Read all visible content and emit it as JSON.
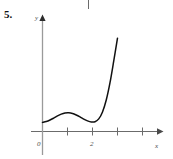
{
  "problem": {
    "number_label": "5."
  },
  "marks": {
    "top_rule": "page-crop-mark"
  },
  "chart_data": {
    "type": "line",
    "title": "",
    "subtitle": "",
    "xlabel": "x",
    "ylabel": "y",
    "xlim": [
      -0.25,
      4.6
    ],
    "ylim": [
      -0.55,
      4.5
    ],
    "grid": false,
    "legend": null,
    "axis_arrows": {
      "x_axis_arrow": true,
      "y_axis_arrow": true
    },
    "x_ticks": [
      {
        "value": 0,
        "label": "0",
        "labeled": true
      },
      {
        "value": 1,
        "label": "",
        "labeled": false
      },
      {
        "value": 2,
        "label": "2",
        "labeled": true
      },
      {
        "value": 3,
        "label": "",
        "labeled": false
      },
      {
        "value": 4,
        "label": "",
        "labeled": false
      }
    ],
    "y_ticks": [],
    "series": [
      {
        "name": "curve",
        "color": "#111111",
        "x": [
          0.0,
          0.15,
          0.3,
          0.45,
          0.6,
          0.75,
          0.9,
          1.05,
          1.2,
          1.35,
          1.5,
          1.65,
          1.8,
          1.95,
          2.1,
          2.25,
          2.4,
          2.55,
          2.7,
          2.85,
          3.0
        ],
        "y": [
          0.42,
          0.46,
          0.53,
          0.62,
          0.72,
          0.8,
          0.85,
          0.86,
          0.83,
          0.76,
          0.67,
          0.57,
          0.49,
          0.44,
          0.45,
          0.58,
          0.9,
          1.45,
          2.25,
          3.25,
          4.3
        ]
      }
    ],
    "annotations": [
      {
        "text": "local maximum near x = 1"
      },
      {
        "text": "local minimum near x = 2"
      },
      {
        "text": "steep increase for x > 2.2"
      }
    ],
    "colors": {
      "curve": "#111111",
      "axis": "#6b6b6b",
      "text": "#4a4a4a"
    }
  }
}
